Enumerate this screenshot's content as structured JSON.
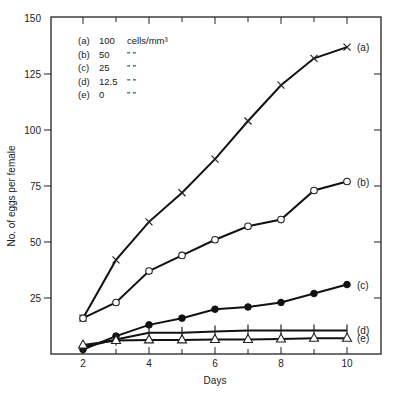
{
  "chart_data": {
    "type": "line",
    "title": "",
    "xlabel": "Days",
    "ylabel": "No. of eggs per female",
    "xlim": [
      1,
      11
    ],
    "ylim": [
      0,
      150
    ],
    "x_ticks": [
      2,
      4,
      6,
      8,
      10
    ],
    "x_minor_ticks": [
      3,
      5,
      7,
      9
    ],
    "y_ticks": [
      25,
      50,
      75,
      100,
      125,
      150
    ],
    "grid": false,
    "legend_position": "top-left inside",
    "legend": [
      {
        "key": "(a)",
        "value": "100",
        "unit": "cells/mm³"
      },
      {
        "key": "(b)",
        "value": "50",
        "unit": "”        ”"
      },
      {
        "key": "(c)",
        "value": "25",
        "unit": "”        ”"
      },
      {
        "key": "(d)",
        "value": "12.5",
        "unit": "”        ”"
      },
      {
        "key": "(e)",
        "value": "0",
        "unit": "”        ”"
      }
    ],
    "x": [
      2,
      3,
      4,
      5,
      6,
      7,
      8,
      9,
      10
    ],
    "series": [
      {
        "name": "(a) 100 cells/mm3",
        "label": "(a)",
        "marker": "x",
        "values": [
          16,
          42,
          59,
          72,
          87,
          104,
          120,
          132,
          137
        ]
      },
      {
        "name": "(b) 50 cells/mm3",
        "label": "(b)",
        "marker": "open-circle",
        "values": [
          16,
          23,
          37,
          44,
          51,
          57,
          60,
          73,
          77
        ]
      },
      {
        "name": "(c) 25 cells/mm3",
        "label": "(c)",
        "marker": "filled-circle",
        "values": [
          2,
          8,
          13,
          16,
          20,
          21,
          23,
          27,
          31
        ]
      },
      {
        "name": "(d) 12.5 cells/mm3",
        "label": "(d)",
        "marker": "plus",
        "values": [
          3,
          6.5,
          9.5,
          9.5,
          10,
          10.5,
          10.5,
          10.5,
          10.5
        ]
      },
      {
        "name": "(e) 0 cells/mm3",
        "label": "(e)",
        "marker": "open-triangle",
        "values": [
          4,
          6,
          6.3,
          6.3,
          6.5,
          6.5,
          6.7,
          7,
          7
        ]
      }
    ]
  }
}
